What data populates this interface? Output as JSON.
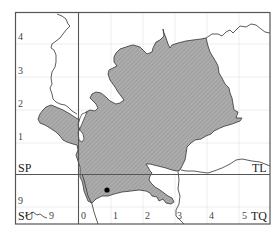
{
  "map": {
    "title": "",
    "colors": {
      "region_fill": "#a9a9a9",
      "hatch": "#8c8c8c",
      "outline": "#333333",
      "frame": "#555555",
      "grid": "#e6e6e6",
      "marker": "#000000"
    },
    "grid_squares": [
      {
        "code": "SP",
        "position": "upper-left"
      },
      {
        "code": "TL",
        "position": "upper-right"
      },
      {
        "code": "SU",
        "position": "lower-left"
      },
      {
        "code": "TQ",
        "position": "lower-right"
      }
    ],
    "labels": {
      "sp": "SP",
      "tl": "TL",
      "su": "SU",
      "tq": "TQ"
    },
    "y_ticks": [
      {
        "label": "4",
        "y": 37
      },
      {
        "label": "3",
        "y": 71
      },
      {
        "label": "2",
        "y": 104
      },
      {
        "label": "1",
        "y": 137
      },
      {
        "label": "9",
        "y": 201
      }
    ],
    "x_ticks": [
      {
        "label": "9",
        "x": 52
      },
      {
        "label": "0",
        "x": 83
      },
      {
        "label": "1",
        "x": 116
      },
      {
        "label": "2",
        "x": 148
      },
      {
        "label": "3",
        "x": 179
      },
      {
        "label": "4",
        "x": 211
      },
      {
        "label": "5",
        "x": 243
      }
    ],
    "marker": {
      "type": "dot",
      "x": 107,
      "y": 190
    }
  }
}
